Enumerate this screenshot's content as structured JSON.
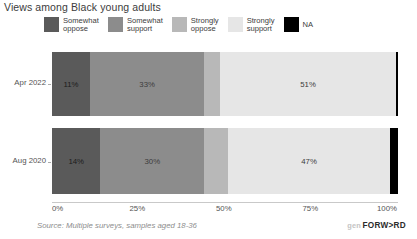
{
  "title": "Views among Black young adults",
  "legend": {
    "items": [
      {
        "label": "Somewhat\noppose",
        "color": "#5a5a5a",
        "wrap": true
      },
      {
        "label": "Somewhat\nsupport",
        "color": "#8c8c8c",
        "wrap": true
      },
      {
        "label": "Strongly\noppose",
        "color": "#b8b8b8",
        "wrap": true
      },
      {
        "label": "Strongly\nsupport",
        "color": "#e6e6e6",
        "wrap": true
      },
      {
        "label": "NA",
        "color": "#000000",
        "wrap": false
      }
    ]
  },
  "source_note": "Source: Multiple surveys, samples aged 18-36",
  "brand": {
    "prefix": "gen",
    "name": "FORW>RD"
  },
  "chart_data": {
    "type": "bar",
    "orientation": "horizontal",
    "stacked": true,
    "stack_mode": "percent",
    "title": "Views among Black young adults",
    "xlabel": "",
    "ylabel": "",
    "xlim": [
      0,
      100
    ],
    "xticks": [
      "0%",
      "25%",
      "50%",
      "75%",
      "100%"
    ],
    "xtick_values": [
      0,
      25,
      50,
      75,
      100
    ],
    "grid": false,
    "legend_position": "top",
    "categories": [
      "Apr 2022",
      "Aug 2020"
    ],
    "series": [
      {
        "name": "Somewhat oppose",
        "color": "#5a5a5a",
        "values": [
          11,
          14
        ],
        "labels": [
          "11%",
          "14%"
        ]
      },
      {
        "name": "Somewhat support",
        "color": "#8c8c8c",
        "values": [
          33,
          30
        ],
        "labels": [
          "33%",
          "30%"
        ]
      },
      {
        "name": "Strongly oppose",
        "color": "#b8b8b8",
        "values": [
          4.5,
          6.8
        ],
        "labels": [
          "",
          ""
        ]
      },
      {
        "name": "Strongly support",
        "color": "#e6e6e6",
        "values": [
          51,
          47
        ],
        "labels": [
          "51%",
          "47%"
        ]
      },
      {
        "name": "NA",
        "color": "#000000",
        "values": [
          0.5,
          2.2
        ],
        "labels": [
          "",
          ""
        ]
      }
    ],
    "rows": [
      {
        "category": "Apr 2022",
        "segments": [
          {
            "name": "Somewhat oppose",
            "value": 11,
            "label": "11%",
            "color": "#5a5a5a"
          },
          {
            "name": "Somewhat support",
            "value": 33,
            "label": "33%",
            "color": "#8c8c8c"
          },
          {
            "name": "Strongly oppose",
            "value": 4.5,
            "label": "",
            "color": "#b8b8b8"
          },
          {
            "name": "Strongly support",
            "value": 51,
            "label": "51%",
            "color": "#e6e6e6"
          },
          {
            "name": "NA",
            "value": 0.5,
            "label": "",
            "color": "#000000"
          }
        ]
      },
      {
        "category": "Aug 2020",
        "segments": [
          {
            "name": "Somewhat oppose",
            "value": 14,
            "label": "14%",
            "color": "#5a5a5a"
          },
          {
            "name": "Somewhat support",
            "value": 30,
            "label": "30%",
            "color": "#8c8c8c"
          },
          {
            "name": "Strongly oppose",
            "value": 6.8,
            "label": "",
            "color": "#b8b8b8"
          },
          {
            "name": "Strongly support",
            "value": 47,
            "label": "47%",
            "color": "#e6e6e6"
          },
          {
            "name": "NA",
            "value": 2.2,
            "label": "",
            "color": "#000000"
          }
        ]
      }
    ]
  }
}
